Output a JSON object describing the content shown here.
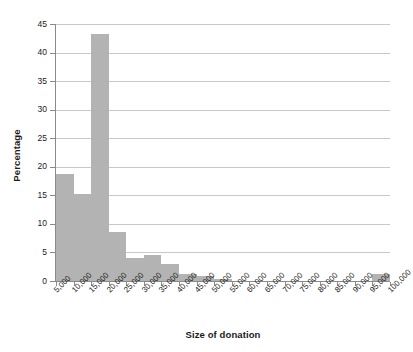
{
  "chart_data": {
    "type": "bar",
    "title": "",
    "subtitle": "",
    "xlabel": "Size of donation",
    "ylabel": "Percentage",
    "xlim": [
      5000,
      100000
    ],
    "ylim": [
      0,
      45
    ],
    "grid": true,
    "legend": null,
    "bin_width": 5000,
    "x_tick_labels": [
      "5,000",
      "10,000",
      "15,000",
      "20,000",
      "25,000",
      "30,000",
      "35,000",
      "40,000",
      "45,000",
      "50,000",
      "55,000",
      "60,000",
      "65,000",
      "70,000",
      "75,000",
      "80,000",
      "85,000",
      "90,000",
      "95,000",
      "100,000"
    ],
    "x_tick_values": [
      5000,
      10000,
      15000,
      20000,
      25000,
      30000,
      35000,
      40000,
      45000,
      50000,
      55000,
      60000,
      65000,
      70000,
      75000,
      80000,
      85000,
      90000,
      95000,
      100000
    ],
    "y_tick_labels": [
      "0",
      "5",
      "10",
      "15",
      "20",
      "25",
      "30",
      "35",
      "40",
      "45"
    ],
    "y_tick_values": [
      0,
      5,
      10,
      15,
      20,
      25,
      30,
      35,
      40,
      45
    ],
    "bar_color": "#b3b3b3",
    "categories": [
      "5,000–10,000",
      "10,000–15,000",
      "15,000–20,000",
      "20,000–25,000",
      "25,000–30,000",
      "30,000–35,000",
      "35,000–40,000",
      "40,000–45,000",
      "45,000–50,000",
      "50,000–55,000",
      "55,000–60,000",
      "60,000–65,000",
      "65,000–70,000",
      "70,000–75,000",
      "75,000–80,000",
      "80,000–85,000",
      "85,000–90,000",
      "90,000–95,000",
      "95,000–100,000"
    ],
    "bin_starts": [
      5000,
      10000,
      15000,
      20000,
      25000,
      30000,
      35000,
      40000,
      45000,
      50000,
      55000,
      60000,
      65000,
      70000,
      75000,
      80000,
      85000,
      90000,
      95000
    ],
    "values": [
      18.7,
      15.2,
      43.2,
      8.6,
      4.0,
      4.5,
      3.0,
      1.2,
      0.8,
      0.4,
      0.0,
      0.0,
      0.0,
      0.0,
      0.0,
      0.0,
      0.0,
      0.0,
      1.3
    ]
  }
}
